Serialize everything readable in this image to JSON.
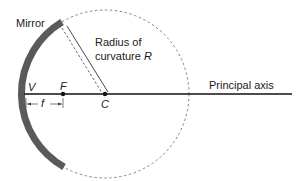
{
  "diagram": {
    "labels": {
      "mirror": "Mirror",
      "radius_line1": "Radius of",
      "radius_line2": "curvature",
      "radius_symbol": "R",
      "vertex": "V",
      "focal_point": "F",
      "center": "C",
      "focal_length": "f",
      "principal_axis": "Principal axis"
    },
    "colors": {
      "mirror": "#5a5a5a",
      "line": "#111111",
      "dashed": "#777777"
    }
  }
}
